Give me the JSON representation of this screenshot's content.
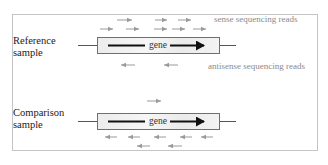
{
  "diagram": {
    "legend": {
      "sense": "sense sequencing reads",
      "antisense": "antisense sequencing reads"
    },
    "colors": {
      "frame": "#c4c4c4",
      "read_arrow": "#9a9a9a",
      "gene_arrow": "#111111",
      "gene_box_border": "#6f6f6f",
      "legend_text": "#8a8a8a"
    },
    "samples": [
      {
        "label_line1": "Reference",
        "label_line2": "sample",
        "gene_label": "gene",
        "sense_reads": 8,
        "antisense_reads": 2
      },
      {
        "label_line1": "Comparison",
        "label_line2": "sample",
        "gene_label": "gene",
        "sense_reads": 1,
        "antisense_reads": 7
      }
    ]
  }
}
